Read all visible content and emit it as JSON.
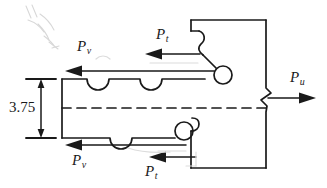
{
  "figure": {
    "type": "engineering-line-drawing",
    "stroke_color": "#1a1a1a",
    "background_color": "#ffffff",
    "dimension": {
      "value": "3.75",
      "orientation": "vertical",
      "arrow_style": "double-headed"
    },
    "force_labels": [
      {
        "id": "pv-top",
        "base": "P",
        "sub": "v",
        "direction": "left"
      },
      {
        "id": "pt-top",
        "base": "P",
        "sub": "t",
        "direction": "left"
      },
      {
        "id": "pu-right",
        "base": "P",
        "sub": "u",
        "direction": "right"
      },
      {
        "id": "pv-bottom",
        "base": "P",
        "sub": "v",
        "direction": "left"
      },
      {
        "id": "pt-bottom",
        "base": "P",
        "sub": "t",
        "direction": "left"
      }
    ],
    "centerline": {
      "style": "dashed",
      "label": ""
    },
    "break_symbol": {
      "style": "zigzag",
      "edge": "right"
    },
    "notches": {
      "top_count": 2,
      "bottom_count": 1,
      "shape": "semicircular"
    },
    "bolt_circles": {
      "count": 3,
      "shape": "circle"
    }
  }
}
